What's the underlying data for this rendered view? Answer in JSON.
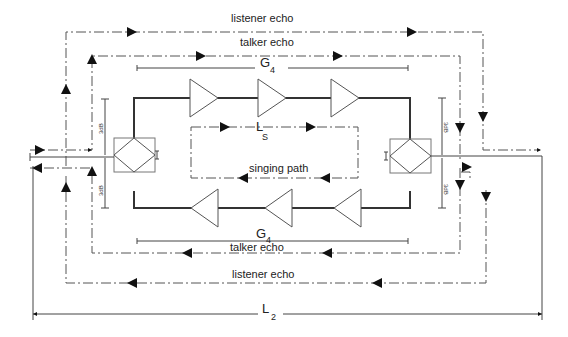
{
  "diagram": {
    "labels": {
      "listener_echo_top": "listener echo",
      "talker_echo_top": "talker echo",
      "g4_top_main": "G",
      "g4_top_sub": "4",
      "ls_main": "L",
      "ls_sub": "S",
      "singing_path": "singing path",
      "g4_bottom_main": "G",
      "g4_bottom_sub": "4",
      "talker_echo_bottom": "talker echo",
      "listener_echo_bottom": "listener echo",
      "l2_main": "L",
      "l2_sub": "2",
      "db_left_top": "3dB",
      "db_left_bottom": "3dB",
      "db_right_top": "3dB",
      "db_right_bottom": "3dB"
    },
    "components": {
      "hybrids": [
        "left-hybrid",
        "right-hybrid"
      ],
      "top_amplifiers": 3,
      "bottom_amplifiers": 3
    },
    "paths": [
      "listener echo",
      "talker echo",
      "singing path"
    ],
    "colors": {
      "line": "#333333",
      "background": "#ffffff"
    }
  }
}
